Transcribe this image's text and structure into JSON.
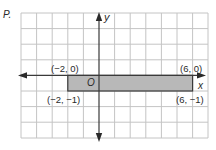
{
  "problem_label": "P.",
  "axes": {
    "x_label": "x",
    "y_label": "y",
    "origin_label": "O"
  },
  "grid": {
    "x_min": -5,
    "x_max": 7,
    "y_min": -4,
    "y_max": 4,
    "line_color": "#c4c4c4",
    "axis_color": "#3a3a3a"
  },
  "rectangle": {
    "fill": "#b8b8b8",
    "stroke": "#3a3a3a",
    "vertices": [
      {
        "x": -2,
        "y": 0,
        "label": "(−2, 0)"
      },
      {
        "x": 6,
        "y": 0,
        "label": "(6, 0)"
      },
      {
        "x": 6,
        "y": -1,
        "label": "(6, −1)"
      },
      {
        "x": -2,
        "y": -1,
        "label": "(−2, −1)"
      }
    ]
  }
}
